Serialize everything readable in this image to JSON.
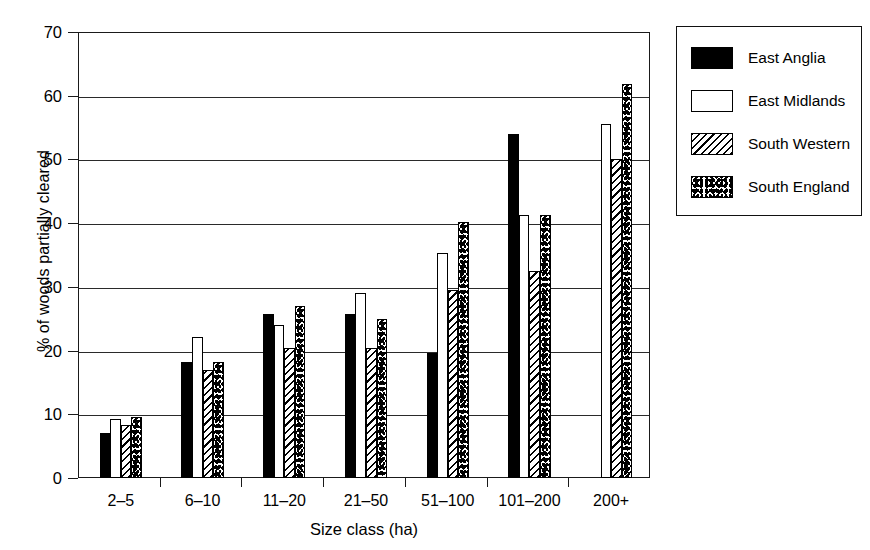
{
  "chart_data": {
    "type": "bar",
    "title": "",
    "xlabel": "Size class (ha)",
    "ylabel": "% of woods partially cleared",
    "categories": [
      "2–5",
      "6–10",
      "11–20",
      "21–50",
      "51–100",
      "101–200",
      "200+"
    ],
    "ylim": [
      0,
      70
    ],
    "yticks": [
      0,
      10,
      20,
      30,
      40,
      50,
      60,
      70
    ],
    "ytick_labels": [
      "0",
      "10",
      "20",
      "30",
      "40",
      "50",
      "60",
      "70"
    ],
    "grid": true,
    "legend_position": "right-outside",
    "series": [
      {
        "name": "East Anglia",
        "pattern": "solid",
        "values": [
          7.0,
          18.2,
          25.8,
          25.8,
          19.6,
          54.0,
          null
        ]
      },
      {
        "name": "East Midlands",
        "pattern": "open",
        "values": [
          9.3,
          22.2,
          24.0,
          29.0,
          35.3,
          41.3,
          55.6
        ]
      },
      {
        "name": "South Western",
        "pattern": "hatch",
        "values": [
          8.3,
          17.0,
          20.4,
          20.4,
          29.5,
          32.5,
          50.0
        ]
      },
      {
        "name": "South England",
        "pattern": "dots",
        "values": [
          9.5,
          18.2,
          27.0,
          25.0,
          40.2,
          41.3,
          61.8
        ]
      }
    ]
  },
  "legend": {
    "entries": [
      {
        "label": "East Anglia",
        "pattern": "solid"
      },
      {
        "label": "East Midlands",
        "pattern": "open"
      },
      {
        "label": "South Western",
        "pattern": "hatch"
      },
      {
        "label": "South England",
        "pattern": "dots"
      }
    ]
  },
  "colors": {
    "axis": "#1a1a1a",
    "gridline": "#2a2a2a",
    "series_solid": "#000000",
    "background": "#ffffff"
  }
}
